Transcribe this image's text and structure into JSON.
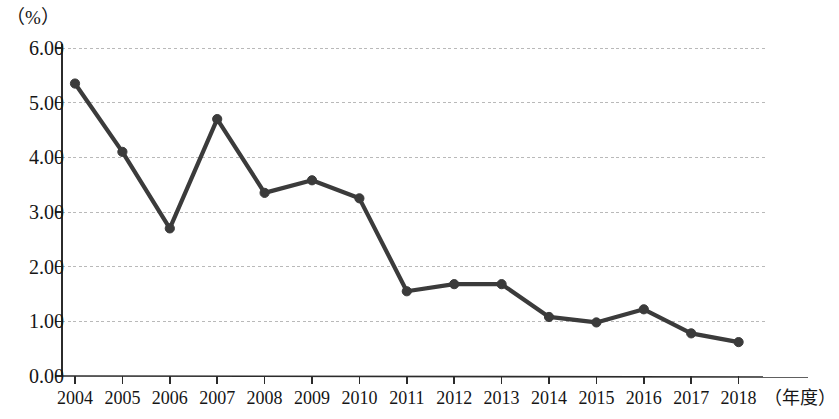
{
  "chart_data": {
    "type": "line",
    "title": "",
    "subtitle": "",
    "xlabel": "（年度）",
    "ylabel": "（%）",
    "categories": [
      "2004",
      "2005",
      "2006",
      "2007",
      "2008",
      "2009",
      "2010",
      "2011",
      "2012",
      "2013",
      "2014",
      "2015",
      "2016",
      "2017",
      "2018"
    ],
    "values": [
      5.35,
      4.1,
      2.7,
      4.7,
      3.35,
      3.58,
      3.25,
      1.55,
      1.68,
      1.68,
      1.08,
      0.98,
      1.22,
      0.78,
      0.62
    ],
    "series": [
      {
        "name": "",
        "values": [
          5.35,
          4.1,
          2.7,
          4.7,
          3.35,
          3.58,
          3.25,
          1.55,
          1.68,
          1.68,
          1.08,
          0.98,
          1.22,
          0.78,
          0.62
        ]
      }
    ],
    "ylim": [
      0.0,
      6.0
    ],
    "y_ticks": [
      "0.00",
      "1.00",
      "2.00",
      "3.00",
      "4.00",
      "5.00",
      "6.00"
    ],
    "y_tick_values": [
      0.0,
      1.0,
      2.0,
      3.0,
      4.0,
      5.0,
      6.0
    ],
    "grid": true,
    "grid_axis": "y",
    "legend": false,
    "legend_position": "none",
    "marker": "circle",
    "line_color": "#3b3b3b",
    "marker_color": "#3b3b3b",
    "grid_color": "#b9b9b9",
    "axis_color": "#2b2b2b",
    "background_color": "#ffffff"
  }
}
